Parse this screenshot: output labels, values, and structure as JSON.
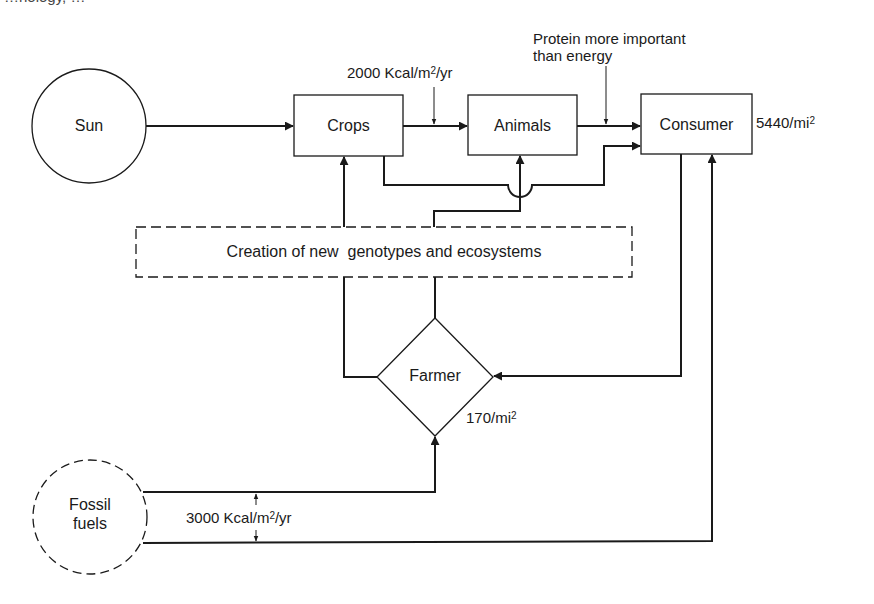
{
  "top_fragment": "…nology, …",
  "nodes": {
    "sun": {
      "label": "Sun",
      "shape": "circle",
      "style": "solid"
    },
    "fossil_fuels": {
      "label_line1": "Fossil",
      "label_line2": "fuels",
      "shape": "circle",
      "style": "dashed"
    },
    "crops": {
      "label": "Crops",
      "shape": "rectangle"
    },
    "animals": {
      "label": "Animals",
      "shape": "rectangle"
    },
    "consumer": {
      "label": "Consumer",
      "shape": "rectangle"
    },
    "farmer": {
      "label": "Farmer",
      "shape": "diamond"
    },
    "creation": {
      "label": "Creation of new  genotypes and ecosystems",
      "shape": "rectangle",
      "style": "dashed"
    }
  },
  "annotations": {
    "crops_animals_energy": {
      "prefix": "2000 Kcal/m",
      "sup": "2",
      "suffix": "/yr"
    },
    "protein_note_line1": "Protein more important",
    "protein_note_line2": "than energy",
    "consumer_density": {
      "prefix": "5440/mi",
      "sup": "2"
    },
    "farmer_density": {
      "prefix": "170/mi",
      "sup": "2"
    },
    "fossil_energy": {
      "prefix": "3000 Kcal/m",
      "sup": "2",
      "suffix": "/yr"
    }
  },
  "edges": [
    {
      "from": "Sun",
      "to": "Crops"
    },
    {
      "from": "Crops",
      "to": "Animals"
    },
    {
      "from": "Animals",
      "to": "Consumer"
    },
    {
      "from": "Crops",
      "to": "Consumer"
    },
    {
      "from": "Creation",
      "to": "Crops"
    },
    {
      "from": "Creation",
      "to": "Animals"
    },
    {
      "from": "Farmer",
      "to": "Creation"
    },
    {
      "from": "Consumer",
      "to": "Farmer"
    },
    {
      "from": "Fossil fuels",
      "to": "Farmer"
    },
    {
      "from": "Fossil fuels",
      "to": "Consumer"
    }
  ],
  "colors": {
    "stroke": "#1a1a1a",
    "background": "#ffffff"
  }
}
